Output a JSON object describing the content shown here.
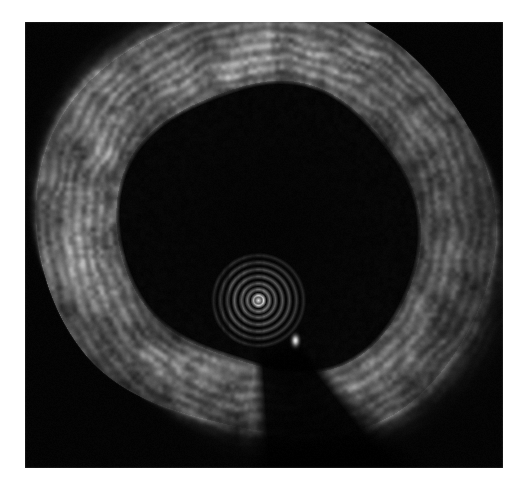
{
  "document": {
    "modality_label": "IVUS",
    "view_label": "Cross-sectional grayscale ultrasound frame",
    "background_color": "#ffffff",
    "scan_background_color": "#000000"
  },
  "frame": {
    "x": 25,
    "y": 22,
    "width": 478,
    "height": 446,
    "border_color": "#d8d8d8"
  },
  "chart_data": {
    "type": "heatmap",
    "title": "",
    "xlabel": "",
    "ylabel": "",
    "grid": false,
    "legend": false,
    "colormap": "grayscale",
    "value_range": [
      0,
      255
    ],
    "render": {
      "width": 478,
      "height": 446,
      "noise_seed": 20240517,
      "base_level": 4
    },
    "geometry": {
      "transducer_center": {
        "x": 233,
        "y": 278
      },
      "lumen_border_center": {
        "x": 245,
        "y": 205
      },
      "lumen_radius_mean": 148,
      "lumen_radius_variation": 10,
      "vessel_outer_radius_mean": 232,
      "vessel_outer_radius_variation": 18
    },
    "catheter_artifact": {
      "center": {
        "x": 233,
        "y": 278
      },
      "ring_radii": [
        5,
        11,
        17,
        24,
        31,
        38,
        45
      ],
      "ring_intensities": [
        210,
        120,
        96,
        88,
        78,
        60,
        40
      ],
      "core_intensity": 235,
      "core_radius": 4
    },
    "guidewire": {
      "bright_spot": {
        "x": 270,
        "y": 318
      },
      "bright_spot_intensity": 250,
      "bright_spot_radius": 7,
      "shadow_start_angle_deg": 52,
      "shadow_end_angle_deg": 86,
      "shadow_attenuation": 0.94
    },
    "wall_sectors": [
      {
        "name": "superior",
        "center_angle_deg": 270,
        "span_deg": 90,
        "peak_intensity": 150,
        "thickness": 78
      },
      {
        "name": "superior-left",
        "center_angle_deg": 225,
        "span_deg": 60,
        "peak_intensity": 140,
        "thickness": 80
      },
      {
        "name": "left",
        "center_angle_deg": 180,
        "span_deg": 70,
        "peak_intensity": 132,
        "thickness": 82
      },
      {
        "name": "inferior-left",
        "center_angle_deg": 135,
        "span_deg": 60,
        "peak_intensity": 138,
        "thickness": 74
      },
      {
        "name": "inferior",
        "center_angle_deg": 100,
        "span_deg": 40,
        "peak_intensity": 96,
        "thickness": 60
      },
      {
        "name": "inferior-right",
        "center_angle_deg": 50,
        "span_deg": 40,
        "peak_intensity": 120,
        "thickness": 66
      },
      {
        "name": "right",
        "center_angle_deg": 0,
        "span_deg": 70,
        "peak_intensity": 88,
        "thickness": 74
      },
      {
        "name": "superior-right",
        "center_angle_deg": 315,
        "span_deg": 60,
        "peak_intensity": 118,
        "thickness": 80
      }
    ],
    "annotations": []
  }
}
